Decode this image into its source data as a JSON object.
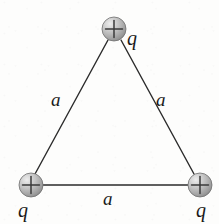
{
  "figure": {
    "background_color": "#fdfdfc",
    "line_color": "#2b2b2b",
    "line_width": 1.4,
    "sphere": {
      "radius": 12,
      "fill_light": "#e3e3e3",
      "fill_mid": "#b9b9b9",
      "fill_dark": "#8e8e8e",
      "edge_color": "#6f6f6f",
      "plus_color": "#3a3a3a",
      "plus_symbol": "+"
    },
    "charges": [
      {
        "id": "charge-top",
        "name": "top-charge",
        "cx": 114,
        "cy": 29,
        "sign": "+",
        "label": "q",
        "label_x": 127,
        "label_y": 28
      },
      {
        "id": "charge-bottom-left",
        "name": "bottom-left-charge",
        "cx": 31,
        "cy": 185,
        "sign": "+",
        "label": "q",
        "label_x": 18,
        "label_y": 200
      },
      {
        "id": "charge-bottom-right",
        "name": "bottom-right-charge",
        "cx": 200,
        "cy": 185,
        "sign": "+",
        "label": "q",
        "label_x": 196,
        "label_y": 200
      }
    ],
    "sides": [
      {
        "id": "side-left",
        "name": "left-side",
        "x1": 108,
        "y1": 40,
        "x2": 35,
        "y2": 174,
        "label": "a",
        "label_x": 51,
        "label_y": 90
      },
      {
        "id": "side-right",
        "name": "right-side",
        "x1": 121,
        "y1": 40,
        "x2": 194,
        "y2": 174,
        "label": "a",
        "label_x": 156,
        "label_y": 90
      },
      {
        "id": "side-bottom",
        "name": "bottom-side",
        "x1": 43,
        "y1": 185,
        "x2": 188,
        "y2": 185,
        "label": "a",
        "label_x": 103,
        "label_y": 189
      }
    ]
  }
}
